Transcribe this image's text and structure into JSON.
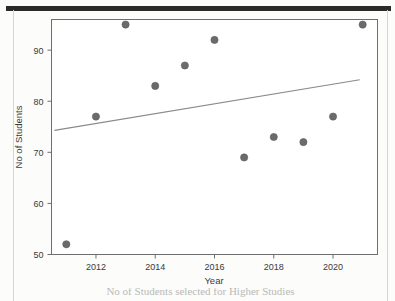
{
  "figure": {
    "y_axis_label": "No of Students",
    "x_axis_label": "Year",
    "caption": "No of Students selected for Higher Studies",
    "point_color": "#6b6b6b",
    "line_color": "#8a8a8a",
    "frame_color": "#6e6e6e"
  },
  "chart_data": {
    "type": "scatter",
    "title": "",
    "xlabel": "Year",
    "ylabel": "No of Students",
    "x": [
      2011,
      2012,
      2013,
      2014,
      2015,
      2016,
      2017,
      2018,
      2019,
      2020,
      2021
    ],
    "values": [
      52,
      77,
      95,
      83,
      87,
      92,
      69,
      73,
      72,
      77,
      95
    ],
    "series": [
      {
        "name": "No of Students",
        "values": [
          52,
          77,
          95,
          83,
          87,
          92,
          69,
          73,
          72,
          77,
          95
        ]
      }
    ],
    "trendline": {
      "type": "linear",
      "x_start": 2010.6,
      "y_start": 74.3,
      "x_end": 2020.9,
      "y_end": 84.2
    },
    "xlim": [
      2010.5,
      2021.5
    ],
    "ylim": [
      50,
      96
    ],
    "xticks": [
      2012,
      2014,
      2016,
      2018,
      2020
    ],
    "xticklabels": [
      "2012",
      "2014",
      "2016",
      "2018",
      "2020"
    ],
    "yticks": [
      50,
      60,
      70,
      80,
      90
    ],
    "yticklabels": [
      "50",
      "60",
      "70",
      "80",
      "90"
    ],
    "grid": false,
    "legend": false
  }
}
